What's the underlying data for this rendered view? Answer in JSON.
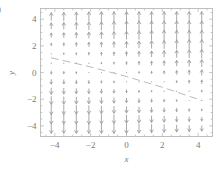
{
  "figure": {
    "panel_label": ")",
    "background": "#ffffff",
    "frame_color": "#b9b9b9",
    "arrow_color": "#9a9a9a",
    "text_color": "#7a7a7a"
  },
  "chart_data": {
    "type": "scatter",
    "plot_kind": "quiver-direction-field",
    "title": "",
    "xlabel": "x",
    "ylabel": "y",
    "xlim": [
      -4.8,
      4.8
    ],
    "ylim": [
      -4.8,
      4.8
    ],
    "xticks": [
      -4,
      -2,
      0,
      2,
      4
    ],
    "xticklabels": [
      "−4",
      "−2",
      "0",
      "2",
      "4"
    ],
    "yticks": [
      -4,
      -2,
      0,
      2,
      4
    ],
    "yticklabels": [
      "−4",
      "−2",
      "0",
      "2",
      "4"
    ],
    "minor_tick_step": 0.5,
    "grid": false,
    "legend": null,
    "grid_x": [
      -4.2,
      -3.5,
      -2.8,
      -2.1,
      -1.4,
      -0.7,
      0,
      0.7,
      1.4,
      2.1,
      2.8,
      3.5,
      4.2
    ],
    "grid_y": [
      -4.2,
      -3.5,
      -2.8,
      -2.1,
      -1.4,
      -0.7,
      0,
      0.7,
      1.4,
      2.1,
      2.8,
      3.5,
      4.2
    ],
    "separatrix": {
      "description": "descending diagonal nullcline where arrows vanish",
      "points": [
        [
          -4.2,
          1.1
        ],
        [
          -2.1,
          0.45
        ],
        [
          0,
          -0.3
        ],
        [
          2.1,
          -1.15
        ],
        [
          4.2,
          -2.1
        ]
      ]
    },
    "field_rule": {
      "u": 0,
      "v_sign_above_separatrix": -1,
      "v_sign_below_separatrix": 1,
      "note": "vertical arrows: downward above the separatrix, upward below it; magnitude grows with distance from the separatrix"
    }
  }
}
